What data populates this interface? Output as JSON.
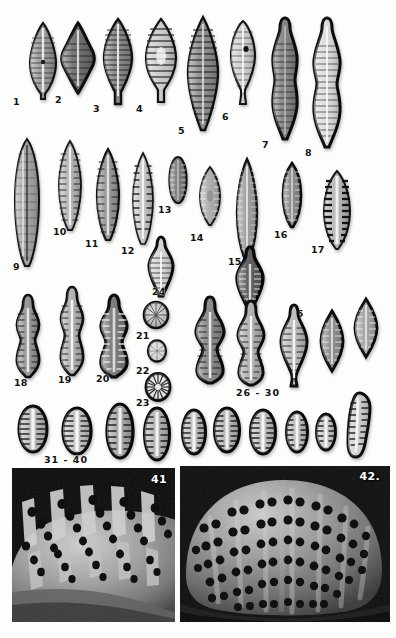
{
  "plate": {
    "kind": "taxonomic-plate",
    "caption_numbers_visible": [
      "1",
      "2",
      "3",
      "4",
      "5",
      "6",
      "7",
      "8",
      "9",
      "10",
      "11",
      "12",
      "13",
      "14",
      "15",
      "16",
      "17",
      "18",
      "19",
      "20",
      "21",
      "22",
      "23",
      "24",
      "25",
      "26 - 30",
      "31 - 40",
      "41",
      "42."
    ],
    "background_color": "#fdfdfb",
    "ink_color": "#1a1a1a"
  },
  "rows": [
    {
      "name": "row-1",
      "figures": [
        {
          "id": "1",
          "label": "1",
          "shape": "lanceolate-rostrate",
          "x": 52,
          "y": 22,
          "w": 34,
          "h": 78,
          "fill": "#9b9b9b",
          "stria": "fine-radiate",
          "label_x": 13,
          "label_y": 97
        },
        {
          "id": "2",
          "label": "2",
          "shape": "rhombic-lanceolate",
          "x": 104,
          "y": 22,
          "w": 40,
          "h": 72,
          "fill": "#6f6f6f",
          "stria": "coarse",
          "label_x": 55,
          "label_y": 95
        },
        {
          "id": "3",
          "label": "3",
          "shape": "lanceolate-cuneate",
          "x": 160,
          "y": 18,
          "w": 36,
          "h": 88,
          "fill": "#8a8a8a",
          "stria": "fine-radiate",
          "label_x": 93,
          "label_y": 104
        },
        {
          "id": "4",
          "label": "4",
          "shape": "lanceolate-rostrate",
          "x": 214,
          "y": 18,
          "w": 38,
          "h": 86,
          "fill": "#cfcfcf",
          "stria": "coarse-radiate",
          "label_x": 136,
          "label_y": 104
        },
        {
          "id": "5",
          "label": "5",
          "shape": "elongate-lanceolate",
          "x": 272,
          "y": 16,
          "w": 38,
          "h": 116,
          "fill": "#8f8f8f",
          "stria": "dense",
          "label_x": 178,
          "label_y": 126
        },
        {
          "id": "6",
          "label": "6",
          "shape": "clavate-capitate",
          "x": 330,
          "y": 20,
          "w": 34,
          "h": 88,
          "fill": "#d2d2d2",
          "stria": "fine",
          "label_x": 222,
          "label_y": 112
        },
        {
          "id": "7",
          "label": "7",
          "shape": "sigmoid-swollen",
          "x": 388,
          "y": 16,
          "w": 34,
          "h": 126,
          "fill": "#858585",
          "stria": "fine-dense",
          "label_x": 262,
          "label_y": 140
        },
        {
          "id": "8",
          "label": "8",
          "shape": "sigmoid-swollen-pale",
          "x": 444,
          "y": 16,
          "w": 34,
          "h": 134,
          "fill": "#dedede",
          "stria": "fine-dense",
          "label_x": 305,
          "label_y": 148
        }
      ]
    },
    {
      "name": "row-2",
      "figures": [
        {
          "id": "9",
          "label": "9",
          "shape": "long-linear-lanceolate",
          "x": 10,
          "y": 146,
          "w": 34,
          "h": 126,
          "fill": "#a6a6a6",
          "stria": "linear",
          "label_x": 13,
          "label_y": 262
        },
        {
          "id": "10",
          "label": "10",
          "shape": "lanceolate",
          "x": 58,
          "y": 148,
          "w": 28,
          "h": 94,
          "fill": "#b6b6b6",
          "stria": "punctate",
          "label_x": 53,
          "label_y": 227
        },
        {
          "id": "11",
          "label": "11",
          "shape": "lanceolate-narrow",
          "x": 96,
          "y": 156,
          "w": 26,
          "h": 92,
          "fill": "#9a9a9a",
          "stria": "punctate",
          "label_x": 85,
          "label_y": 239
        },
        {
          "id": "12",
          "label": "12",
          "shape": "narrow-lanceolate",
          "x": 132,
          "y": 160,
          "w": 24,
          "h": 90,
          "fill": "#c8c8c8",
          "stria": "punctate",
          "label_x": 121,
          "label_y": 246
        },
        {
          "id": "13",
          "label": "13",
          "shape": "small-elliptic",
          "x": 168,
          "y": 160,
          "w": 22,
          "h": 48,
          "fill": "#7e7e7e",
          "stria": "fine",
          "label_x": 158,
          "label_y": 205
        },
        {
          "id": "14",
          "label": "14",
          "shape": "elliptic-lanceolate",
          "x": 200,
          "y": 168,
          "w": 26,
          "h": 58,
          "fill": "#b0b0b0",
          "stria": "fine",
          "label_x": 190,
          "label_y": 233
        },
        {
          "id": "15",
          "label": "15",
          "shape": "long-lanceolate",
          "x": 236,
          "y": 162,
          "w": 26,
          "h": 100,
          "fill": "#a2a2a2",
          "stria": "dense",
          "label_x": 228,
          "label_y": 257
        },
        {
          "id": "16",
          "label": "16",
          "shape": "narrow-elliptic",
          "x": 282,
          "y": 164,
          "w": 24,
          "h": 64,
          "fill": "#8c8c8c",
          "stria": "fine",
          "label_x": 274,
          "label_y": 230
        },
        {
          "id": "17",
          "label": "17",
          "shape": "broad-elliptic-coarse",
          "x": 322,
          "y": 172,
          "w": 34,
          "h": 78,
          "fill": "#b8b8b8",
          "stria": "very-coarse",
          "label_x": 311,
          "label_y": 245
        }
      ]
    },
    {
      "name": "row-3",
      "figures": [
        {
          "id": "18",
          "label": "18",
          "shape": "triundulate",
          "x": 12,
          "y": 296,
          "w": 32,
          "h": 82,
          "fill": "#989898",
          "stria": "fine",
          "label_x": 14,
          "label_y": 378
        },
        {
          "id": "19",
          "label": "19",
          "shape": "triundulate-slender",
          "x": 56,
          "y": 288,
          "w": 32,
          "h": 88,
          "fill": "#b4b4b4",
          "stria": "fine",
          "label_x": 58,
          "label_y": 375
        },
        {
          "id": "20",
          "label": "20",
          "shape": "triundulate-broad",
          "x": 98,
          "y": 296,
          "w": 36,
          "h": 82,
          "fill": "#7c7c7c",
          "stria": "coarse",
          "label_x": 96,
          "label_y": 374
        },
        {
          "id": "21",
          "label": "21",
          "shape": "circular",
          "x": 142,
          "y": 302,
          "w": 26,
          "h": 28,
          "fill": "#a8a8a8",
          "stria": "radiate",
          "label_x": 138,
          "label_y": 331
        },
        {
          "id": "22",
          "label": "22",
          "shape": "circular-small",
          "x": 146,
          "y": 340,
          "w": 20,
          "h": 22,
          "fill": "#c4c4c4",
          "stria": "radiate",
          "label_x": 138,
          "label_y": 367
        },
        {
          "id": "23",
          "label": "23",
          "shape": "circular-coarse",
          "x": 144,
          "y": 372,
          "w": 26,
          "h": 28,
          "fill": "#d6d6d6",
          "stria": "radiate-coarse",
          "label_x": 138,
          "label_y": 398
        },
        {
          "id": "24",
          "label": "24",
          "shape": "rhombic-capitate",
          "x": 148,
          "y": 236,
          "w": 30,
          "h": 62,
          "fill": "#d8d8d8",
          "stria": "fine",
          "label_x": 152,
          "label_y": 287
        },
        {
          "id": "25",
          "label": "25",
          "shape": "rhombic-stauroneiform",
          "x": 236,
          "y": 248,
          "w": 32,
          "h": 66,
          "fill": "#5e5e5e",
          "stria": "coarse",
          "label_x": 290,
          "label_y": 311
        },
        {
          "id": "26",
          "label": "",
          "shape": "strongly-triundulate",
          "x": 196,
          "y": 298,
          "w": 36,
          "h": 86,
          "fill": "#8b8b8b",
          "stria": "coarse",
          "label_x": 0,
          "label_y": 0
        },
        {
          "id": "27",
          "label": "",
          "shape": "strongly-triundulate",
          "x": 238,
          "y": 300,
          "w": 34,
          "h": 86,
          "fill": "#b2b2b2",
          "stria": "coarse",
          "label_x": 0,
          "label_y": 0
        },
        {
          "id": "28",
          "label": "",
          "shape": "rhombic-capitate-long",
          "x": 282,
          "y": 306,
          "w": 32,
          "h": 82,
          "fill": "#c0c0c0",
          "stria": "coarse",
          "label_x": 0,
          "label_y": 0
        },
        {
          "id": "29",
          "label": "",
          "shape": "rhombic",
          "x": 322,
          "y": 312,
          "w": 28,
          "h": 60,
          "fill": "#8f8f8f",
          "stria": "coarse",
          "label_x": 0,
          "label_y": 0
        },
        {
          "id": "30",
          "label": "",
          "shape": "rhombic-elliptic",
          "x": 356,
          "y": 300,
          "w": 28,
          "h": 58,
          "fill": "#a5a5a5",
          "stria": "coarse",
          "label_x": 0,
          "label_y": 0
        }
      ],
      "range_label": {
        "text": "26 - 30",
        "x": 236,
        "y": 388
      }
    },
    {
      "name": "row-4",
      "figures": [
        {
          "id": "31",
          "label": "",
          "shape": "broad-elliptic",
          "x": 18,
          "y": 406,
          "w": 32,
          "h": 48,
          "fill": "#bdbdbd",
          "stria": "coarse",
          "label_x": 0,
          "label_y": 0
        },
        {
          "id": "32",
          "label": "",
          "shape": "broad-elliptic",
          "x": 62,
          "y": 408,
          "w": 32,
          "h": 48,
          "fill": "#c6c6c6",
          "stria": "coarse",
          "label_x": 0,
          "label_y": 0
        },
        {
          "id": "33",
          "label": "",
          "shape": "elliptic-tall",
          "x": 106,
          "y": 406,
          "w": 30,
          "h": 56,
          "fill": "#a9a9a9",
          "stria": "coarse",
          "label_x": 0,
          "label_y": 0
        },
        {
          "id": "34",
          "label": "",
          "shape": "elliptic-tall",
          "x": 144,
          "y": 410,
          "w": 28,
          "h": 54,
          "fill": "#b5b5b5",
          "stria": "coarse",
          "label_x": 0,
          "label_y": 0
        },
        {
          "id": "35",
          "label": "",
          "shape": "elliptic",
          "x": 180,
          "y": 410,
          "w": 26,
          "h": 46,
          "fill": "#c0c0c0",
          "stria": "coarse",
          "label_x": 0,
          "label_y": 0
        },
        {
          "id": "36",
          "label": "",
          "shape": "elliptic",
          "x": 212,
          "y": 408,
          "w": 28,
          "h": 46,
          "fill": "#b8b8b8",
          "stria": "coarse",
          "label_x": 0,
          "label_y": 0
        },
        {
          "id": "37",
          "label": "",
          "shape": "elliptic",
          "x": 248,
          "y": 410,
          "w": 28,
          "h": 48,
          "fill": "#c2c2c2",
          "stria": "coarse",
          "label_x": 0,
          "label_y": 0
        },
        {
          "id": "38",
          "label": "",
          "shape": "elliptic-small",
          "x": 284,
          "y": 412,
          "w": 24,
          "h": 42,
          "fill": "#bfbfbf",
          "stria": "coarse",
          "label_x": 0,
          "label_y": 0
        },
        {
          "id": "39",
          "label": "",
          "shape": "elliptic-small",
          "x": 314,
          "y": 414,
          "w": 22,
          "h": 38,
          "fill": "#cacaca",
          "stria": "coarse",
          "label_x": 0,
          "label_y": 0
        },
        {
          "id": "40",
          "label": "",
          "shape": "clavate",
          "x": 346,
          "y": 396,
          "w": 28,
          "h": 62,
          "fill": "#d0d0d0",
          "stria": "coarse",
          "label_x": 0,
          "label_y": 0
        }
      ],
      "range_label": {
        "text": "31 - 40",
        "x": 44,
        "y": 455
      }
    }
  ],
  "sem_panels": [
    {
      "name": "sem-41",
      "label": "41",
      "x": 12,
      "y": 468,
      "w": 163,
      "h": 154,
      "label_x": 140,
      "label_y": 474,
      "subject": "valve-surface-detail-oblique",
      "background_color": "#0d0d0d",
      "surface_color": "#9a9a9a"
    },
    {
      "name": "sem-42",
      "label": "42.",
      "x": 180,
      "y": 466,
      "w": 210,
      "h": 156,
      "label_x": 352,
      "label_y": 472,
      "subject": "whole-valve-external-view",
      "background_color": "#101010",
      "surface_color": "#a4a4a4"
    }
  ]
}
